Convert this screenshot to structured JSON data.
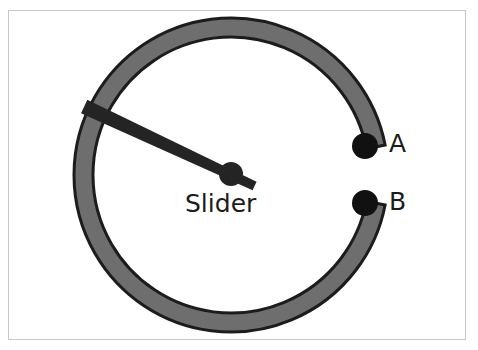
{
  "figure": {
    "background_color": "#ffffff",
    "frame": {
      "name": "image-border",
      "color": "#c8c8c8",
      "x": 8,
      "y": 10,
      "width": 458,
      "height": 330
    }
  },
  "labels": {
    "slider": "Slider",
    "marker_a": "A",
    "marker_b": "B"
  },
  "colors": {
    "ring_fill": "#6e6e6e",
    "ring_stroke": "#1c1c1c",
    "needle": "#242424",
    "marker": "#111111",
    "text": "#1c1c1c"
  },
  "geometry": {
    "center_x": 231,
    "center_y": 175,
    "ring_outer_radius": 157,
    "ring_inner_radius": 138,
    "ring_stroke_width": 3,
    "gap_start_deg": -11,
    "gap_end_deg": 11,
    "needle_angle_deg": 155,
    "needle_length": 162,
    "needle_width": 11,
    "needle_tail_length": 26,
    "hub_radius": 12,
    "marker_radius": 13,
    "marker_a": {
      "x": 365,
      "y": 146
    },
    "marker_b": {
      "x": 365,
      "y": 203
    }
  },
  "chart_data": {
    "type": "diagram",
    "title": "Slider",
    "elements": [
      {
        "name": "ring-track",
        "shape": "annulus",
        "fill": "#6e6e6e",
        "stroke": "#1c1c1c",
        "gap": true
      },
      {
        "name": "slider-needle",
        "shape": "arm",
        "fill": "#242424",
        "angle_deg": 155
      },
      {
        "name": "pivot-hub",
        "shape": "circle",
        "fill": "#242424"
      },
      {
        "name": "marker-a",
        "shape": "circle",
        "fill": "#111111",
        "label": "A"
      },
      {
        "name": "marker-b",
        "shape": "circle",
        "fill": "#111111",
        "label": "B"
      }
    ],
    "annotations": [
      "Slider",
      "A",
      "B"
    ]
  }
}
